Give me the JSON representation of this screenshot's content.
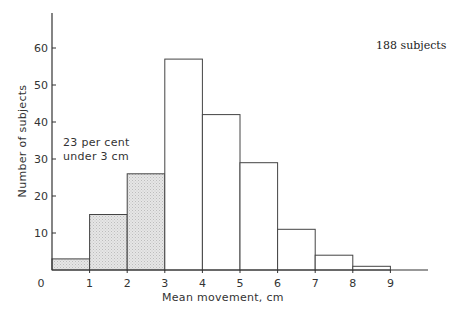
{
  "chart_data": {
    "type": "bar",
    "title": "",
    "xlabel": "Mean movement, cm",
    "ylabel": "Number of subjects",
    "bins": [
      [
        0,
        1
      ],
      [
        1,
        2
      ],
      [
        2,
        3
      ],
      [
        3,
        4
      ],
      [
        4,
        5
      ],
      [
        5,
        6
      ],
      [
        6,
        7
      ],
      [
        7,
        8
      ],
      [
        8,
        9
      ]
    ],
    "categories": [
      "0-1",
      "1-2",
      "2-3",
      "3-4",
      "4-5",
      "5-6",
      "6-7",
      "7-8",
      "8-9"
    ],
    "values": [
      3,
      15,
      26,
      57,
      42,
      29,
      11,
      4,
      1
    ],
    "shaded": [
      true,
      true,
      true,
      false,
      false,
      false,
      false,
      false,
      false
    ],
    "x_ticks": [
      "0",
      "1",
      "2",
      "3",
      "4",
      "5",
      "6",
      "7",
      "8",
      "9"
    ],
    "y_ticks": [
      "10",
      "20",
      "30",
      "40",
      "50",
      "60"
    ],
    "ylim": [
      0,
      70
    ],
    "xlim": [
      0,
      10
    ],
    "grid": false,
    "annotations": [
      {
        "text": "23 per cent",
        "line": 1
      },
      {
        "text": "under 3 cm",
        "line": 2
      },
      {
        "text": "188 subjects"
      }
    ]
  },
  "labels": {
    "xlabel": "Mean movement, cm",
    "ylabel": "Number of subjects",
    "annot_line1": "23 per cent",
    "annot_line2": "under 3 cm",
    "total": "188 subjects",
    "origin": "0"
  },
  "colors": {
    "axis": "#333333",
    "bar_stroke": "#444444",
    "shaded_fill": "#e2e2e2",
    "open_fill": "#ffffff"
  }
}
